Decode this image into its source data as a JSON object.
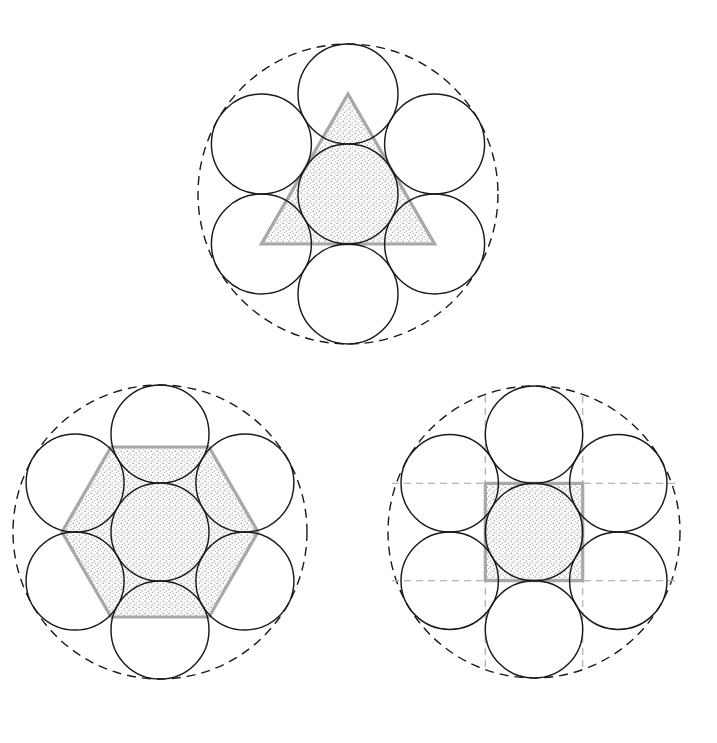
{
  "document": {
    "title": "Circle Packing with Inscribed Polygons",
    "background_color": "#ffffff",
    "width": 717,
    "height": 743
  },
  "style": {
    "circle_stroke": "#1a1a1a",
    "dashed_circle_stroke": "#1a1a1a",
    "polygon_stroke": "#a8a8a8",
    "stipple_fill": "#f2f2f2",
    "stipple_dot": "#9e9e9e",
    "gridline_stroke": "#b4b4b4"
  },
  "chart_data": {
    "type": "diagram",
    "panels": [
      {
        "id": "panel-triangle",
        "label": "Triangle",
        "position": "top-center",
        "center": [
          348,
          194
        ],
        "unit_radius": 50,
        "outer_dashed_radius": 150,
        "circle_count": 7,
        "circle_centers": [
          [
            348,
            194
          ],
          [
            348,
            94
          ],
          [
            434.6,
            144
          ],
          [
            434.6,
            244
          ],
          [
            348,
            294
          ],
          [
            261.4,
            244
          ],
          [
            261.4,
            144
          ]
        ],
        "polygon": {
          "shape": "triangle",
          "sides": 3,
          "orientation": "apex-up",
          "circumradius": 100,
          "vertices": [
            [
              348,
              94
            ],
            [
              434.6,
              244
            ],
            [
              261.4,
              244
            ]
          ],
          "fill": "stipple",
          "stroke": "#a8a8a8"
        },
        "gridlines": false
      },
      {
        "id": "panel-hexagon",
        "label": "Hexagon",
        "position": "bottom-left",
        "center": [
          160,
          532
        ],
        "unit_radius": 49,
        "outer_dashed_radius": 147,
        "circle_count": 7,
        "circle_centers": [
          [
            160,
            532
          ],
          [
            160,
            434
          ],
          [
            244.9,
            483
          ],
          [
            244.9,
            581
          ],
          [
            160,
            630
          ],
          [
            75.1,
            581
          ],
          [
            75.1,
            483
          ]
        ],
        "polygon": {
          "shape": "hexagon",
          "sides": 6,
          "orientation": "pointy-left-right",
          "circumradius": 98,
          "vertices": [
            [
              258,
              532
            ],
            [
              209,
              617
            ],
            [
              111,
              617
            ],
            [
              62,
              532
            ],
            [
              111,
              447
            ],
            [
              209,
              447
            ]
          ],
          "fill": "stipple",
          "stroke": "#a8a8a8"
        },
        "gridlines": false
      },
      {
        "id": "panel-square",
        "label": "Square",
        "position": "bottom-right",
        "center": [
          534,
          532
        ],
        "unit_radius": 48.7,
        "outer_dashed_radius": 146,
        "circle_count": 7,
        "circle_centers": [
          [
            534,
            532
          ],
          [
            534,
            434.6
          ],
          [
            618.3,
            483.3
          ],
          [
            618.3,
            580.7
          ],
          [
            534,
            629.4
          ],
          [
            449.7,
            580.7
          ],
          [
            449.7,
            483.3
          ]
        ],
        "polygon": {
          "shape": "square",
          "sides": 4,
          "orientation": "axis-aligned",
          "half_side": 48.7,
          "vertices": [
            [
              485.3,
              483.3
            ],
            [
              582.7,
              483.3
            ],
            [
              582.7,
              580.7
            ],
            [
              485.3,
              580.7
            ]
          ],
          "fill": "stipple",
          "stroke": "#a8a8a8"
        },
        "gridlines": true,
        "gridline_set": {
          "vertical_x": [
            485.3,
            582.7
          ],
          "horizontal_y": [
            483.3,
            580.7
          ],
          "vertical_extent": [
            396,
            672
          ],
          "horizontal_extent": [
            392,
            676
          ],
          "style": "dashed",
          "color": "#b4b4b4"
        }
      }
    ],
    "legend": [],
    "annotations": []
  }
}
